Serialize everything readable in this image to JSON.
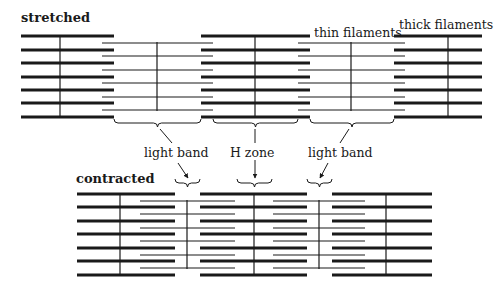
{
  "labels": {
    "stretched": "stretched",
    "contracted": "contracted",
    "thin_filaments": "thin filaments",
    "thick_filaments": "thick filaments",
    "light_band_left": "light band",
    "h_zone": "H zone",
    "light_band_right": "light band"
  },
  "diagram": {
    "colors": {
      "ink": "#1a1a1a",
      "background": "#ffffff"
    },
    "stretched": {
      "thick_rows_y": [
        36,
        50,
        63,
        77,
        90,
        103,
        117
      ],
      "thin_rows_y": [
        43,
        56,
        70,
        83,
        97,
        110
      ],
      "thick_groups": [
        {
          "x1": 21,
          "x2": 114,
          "center_line_x": 60
        },
        {
          "x1": 201,
          "x2": 310,
          "center_line_x": 255
        },
        {
          "x1": 394,
          "x2": 482,
          "center_line_x": 448
        }
      ],
      "thin_groups": [
        {
          "x1": 102,
          "x2": 213,
          "z_line_x": 157
        },
        {
          "x1": 298,
          "x2": 405,
          "z_line_x": 351
        }
      ],
      "braces": [
        {
          "name": "light-band-left",
          "x1": 114,
          "x2": 201,
          "y": 123
        },
        {
          "name": "h-zone",
          "x1": 213,
          "x2": 298,
          "y": 123
        },
        {
          "name": "light-band-right",
          "x1": 310,
          "x2": 394,
          "y": 123
        }
      ]
    },
    "contracted": {
      "thick_rows_y": [
        194,
        207,
        221,
        234,
        248,
        261,
        275
      ],
      "thin_rows_y": [
        201,
        214,
        228,
        241,
        255,
        268
      ],
      "thick_groups": [
        {
          "x1": 77,
          "x2": 175,
          "center_line_x": 120
        },
        {
          "x1": 200,
          "x2": 307,
          "center_line_x": 254
        },
        {
          "x1": 332,
          "x2": 432,
          "center_line_x": 386
        }
      ],
      "thin_groups": [
        {
          "x1": 140,
          "x2": 235,
          "z_line_x": 187
        },
        {
          "x1": 273,
          "x2": 365,
          "z_line_x": 319
        }
      ],
      "braces": [
        {
          "name": "light-band-left",
          "x1": 175,
          "x2": 200,
          "y": 183
        },
        {
          "name": "h-zone",
          "x1": 237,
          "x2": 272,
          "y": 183
        },
        {
          "name": "light-band-right",
          "x1": 307,
          "x2": 332,
          "y": 183
        }
      ]
    },
    "arrows": [
      {
        "name": "light-band-left-pointer-up",
        "from": [
          172,
          143
        ],
        "to": [
          160,
          129
        ]
      },
      {
        "name": "light-band-left-pointer-down",
        "from": [
          178,
          163
        ],
        "to": [
          188,
          178
        ]
      },
      {
        "name": "h-zone-pointer-up",
        "from": [
          255,
          143
        ],
        "to": [
          255,
          129
        ]
      },
      {
        "name": "h-zone-pointer-down",
        "from": [
          255,
          160
        ],
        "to": [
          255,
          178
        ]
      },
      {
        "name": "light-band-right-pointer-up",
        "from": [
          340,
          143
        ],
        "to": [
          349,
          129
        ]
      },
      {
        "name": "light-band-right-pointer-down",
        "from": [
          328,
          163
        ],
        "to": [
          320,
          178
        ]
      }
    ]
  }
}
